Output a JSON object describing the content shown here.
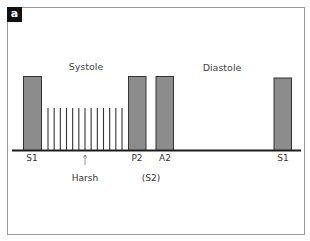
{
  "panel": {
    "badge": "a"
  },
  "phases": [
    {
      "label": "Systole",
      "x": 86,
      "y": 66
    },
    {
      "label": "Diastole",
      "x": 222,
      "y": 67
    }
  ],
  "heart_sounds": [
    {
      "name": "S1",
      "label": "S1",
      "x1": 23.5,
      "x2": 41.5,
      "top": 76.5,
      "label_x": 32,
      "label_y": 158
    },
    {
      "name": "P2",
      "label": "P2",
      "x1": 128.5,
      "x2": 146,
      "top": 76.5,
      "label_x": 137,
      "label_y": 158
    },
    {
      "name": "A2",
      "label": "A2",
      "x1": 156,
      "x2": 173.5,
      "top": 76.5,
      "label_x": 165,
      "label_y": 158
    },
    {
      "name": "S1",
      "label": "S1",
      "x1": 274,
      "x2": 291.5,
      "top": 78,
      "label_x": 283,
      "label_y": 158
    }
  ],
  "murmur": {
    "label": "Harsh",
    "line_count": 13,
    "x_start": 48,
    "x_end": 122,
    "top": 108,
    "arrow_x": 85,
    "arrow_top": 155,
    "arrow_bottom": 165,
    "label_x": 85,
    "label_y": 178
  },
  "s2_annotation": {
    "label": "(S2)",
    "x": 151,
    "y": 178
  },
  "baseline": {
    "x1": 12,
    "x2": 301,
    "y": 150.5
  },
  "colors": {
    "bar_fill": "#8c8c8c",
    "bar_stroke": "#333333",
    "baseline": "#1e1e1e",
    "murmur_line": "#333333",
    "frame": "#9a9a9a",
    "text": "#333333"
  }
}
